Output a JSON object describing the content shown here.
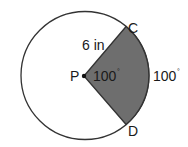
{
  "diagram": {
    "type": "circle-sector",
    "center_label": "P",
    "point_labels": {
      "top": "C",
      "bottom": "D"
    },
    "radius_label": "6 in",
    "central_angle_label": "100",
    "arc_measure_label": "100",
    "degree_symbol": "°",
    "colors": {
      "sector_fill": "#6e6e6e",
      "stroke": "#333333",
      "background": "#ffffff"
    }
  }
}
